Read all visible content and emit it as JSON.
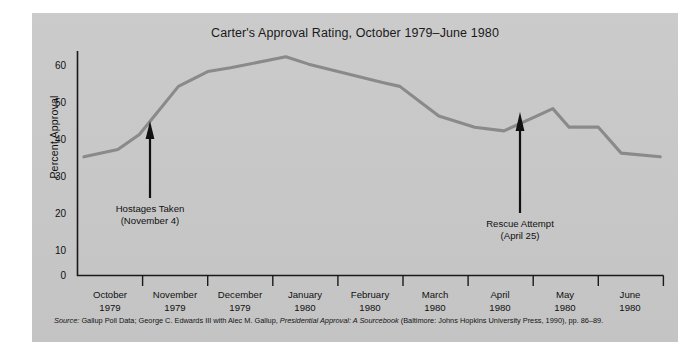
{
  "figure": {
    "title": "Carter's Approval Rating, October 1979–June 1980",
    "background_color": "#c9c9c9",
    "line_color": "#8a8a8a",
    "axis_color": "#1a1a1a"
  },
  "source_note": {
    "label": "Source:",
    "text_before_italic": " Gallup Poll Data; George C. Edwards III with Alec M. Gallup, ",
    "italic_title": "Presidential Approval: A Sourcebook",
    "text_after_italic": " (Baltimore: Johns Hopkins University Press, 1990), pp. 86–89."
  },
  "annotations": [
    {
      "id": "hostages-taken",
      "line1": "Hostages Taken",
      "line2": "(November 4)"
    },
    {
      "id": "rescue-attempt",
      "line1": "Rescue Attempt",
      "line2": "(April 25)"
    }
  ],
  "chart_data": {
    "type": "line",
    "title": "Carter's Approval Rating, October 1979–June 1980",
    "xlabel": "",
    "ylabel": "Percent Approval",
    "ylim": [
      0,
      60
    ],
    "yticks": [
      0,
      10,
      20,
      30,
      40,
      50,
      60
    ],
    "ytick_labels": [
      "0",
      "10",
      "20",
      "30",
      "40",
      "50",
      "60"
    ],
    "grid": false,
    "legend": "none",
    "categories": [
      "October 1979",
      "November 1979",
      "December 1979",
      "January 1980",
      "February 1980",
      "March 1980",
      "April 1980",
      "May 1980",
      "June 1980"
    ],
    "xtick_labels": [
      {
        "month": "October",
        "year": "1979"
      },
      {
        "month": "November",
        "year": "1979"
      },
      {
        "month": "December",
        "year": "1979"
      },
      {
        "month": "January",
        "year": "1980"
      },
      {
        "month": "February",
        "year": "1980"
      },
      {
        "month": "March",
        "year": "1980"
      },
      {
        "month": "April",
        "year": "1980"
      },
      {
        "month": "May",
        "year": "1980"
      },
      {
        "month": "June",
        "year": "1980"
      }
    ],
    "series": [
      {
        "name": "Percent Approval",
        "color": "#8a8a8a",
        "points": [
          {
            "x": 0.1,
            "y": 32
          },
          {
            "x": 0.62,
            "y": 34
          },
          {
            "x": 0.95,
            "y": 38
          },
          {
            "x": 1.55,
            "y": 51
          },
          {
            "x": 2.0,
            "y": 55
          },
          {
            "x": 2.35,
            "y": 56
          },
          {
            "x": 3.2,
            "y": 59
          },
          {
            "x": 3.55,
            "y": 57
          },
          {
            "x": 4.7,
            "y": 52
          },
          {
            "x": 4.95,
            "y": 51
          },
          {
            "x": 5.25,
            "y": 47
          },
          {
            "x": 5.55,
            "y": 43
          },
          {
            "x": 6.1,
            "y": 40
          },
          {
            "x": 6.55,
            "y": 39
          },
          {
            "x": 7.05,
            "y": 43
          },
          {
            "x": 7.3,
            "y": 45
          },
          {
            "x": 7.55,
            "y": 40
          },
          {
            "x": 8.0,
            "y": 40
          },
          {
            "x": 8.35,
            "y": 33
          },
          {
            "x": 8.95,
            "y": 32
          }
        ]
      }
    ],
    "event_markers": [
      {
        "label": "Hostages Taken",
        "sublabel": "(November 4)",
        "x": 1.12,
        "value_at_event": 38
      },
      {
        "label": "Rescue Attempt",
        "sublabel": "(April 25)",
        "x": 6.8,
        "value_at_event": 40
      }
    ]
  }
}
